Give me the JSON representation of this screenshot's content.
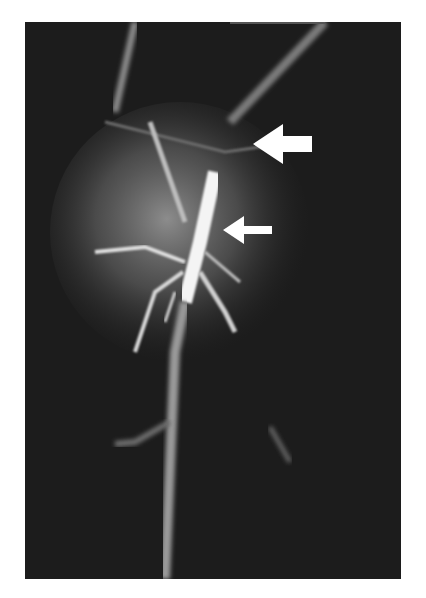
{
  "figure": {
    "type": "angiogram-radiograph",
    "background_color": "#1a1a1a",
    "page_color": "#ffffff",
    "arrows": [
      {
        "name": "large-arrow",
        "direction": "left",
        "color": "#ffffff"
      },
      {
        "name": "small-arrow",
        "direction": "left",
        "color": "#ffffff"
      }
    ]
  }
}
